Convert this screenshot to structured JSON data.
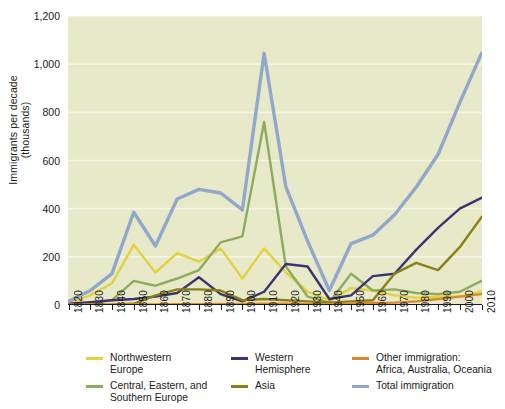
{
  "chart_data": {
    "type": "line",
    "title": "",
    "xlabel": "",
    "ylabel": "Immigrants per decade\n(thousands)",
    "ylabel_line1": "Immigrants per decade",
    "ylabel_line2": "(thousands)",
    "ylim": [
      0,
      1200
    ],
    "ytick_step": 200,
    "yticks": [
      0,
      200,
      400,
      600,
      800,
      1000,
      1200
    ],
    "ytick_labels": [
      "0",
      "200",
      "400",
      "600",
      "800",
      "1,000",
      "1,200"
    ],
    "grid": true,
    "grid_color": "#f4f5e4",
    "plot_background": "#e8e9c9",
    "legend_position": "bottom",
    "x": [
      1820,
      1830,
      1840,
      1850,
      1860,
      1870,
      1880,
      1890,
      1900,
      1910,
      1920,
      1930,
      1940,
      1950,
      1960,
      1970,
      1980,
      1990,
      2000,
      2010
    ],
    "xtick_labels": [
      "1820",
      "1830",
      "1840",
      "1850",
      "1860",
      "1870",
      "1880",
      "1890",
      "1900",
      "1910",
      "1920",
      "1930",
      "1940",
      "1950",
      "1960",
      "1970",
      "1980",
      "1990",
      "2000",
      "2010"
    ],
    "series": [
      {
        "name": "Northwestern Europe",
        "color": "#e3d23f",
        "values": [
          8,
          40,
          90,
          250,
          135,
          215,
          180,
          235,
          110,
          235,
          135,
          55,
          20,
          70,
          60,
          40,
          30,
          35,
          35,
          55
        ]
      },
      {
        "name": "Central, Eastern, and Southern Europe",
        "color": "#8bac5f",
        "values": [
          2,
          5,
          20,
          100,
          80,
          110,
          145,
          260,
          285,
          760,
          160,
          35,
          10,
          130,
          60,
          65,
          50,
          45,
          55,
          100
        ]
      },
      {
        "name": "Western Hemisphere",
        "color": "#3c3470",
        "values": [
          5,
          12,
          20,
          25,
          35,
          50,
          115,
          45,
          15,
          55,
          170,
          160,
          25,
          40,
          120,
          130,
          230,
          320,
          400,
          445
        ]
      },
      {
        "name": "Asia",
        "color": "#8a8019",
        "values": [
          1,
          1,
          2,
          5,
          40,
          65,
          65,
          60,
          20,
          25,
          20,
          15,
          10,
          15,
          20,
          130,
          175,
          145,
          240,
          365
        ]
      },
      {
        "name": "Other immigration: Africa, Australia, Oceania",
        "color": "#d78a2b",
        "values": [
          1,
          1,
          1,
          2,
          2,
          3,
          3,
          4,
          4,
          5,
          5,
          4,
          3,
          5,
          8,
          10,
          15,
          25,
          35,
          45
        ]
      },
      {
        "name": "Total immigration",
        "color": "#8fa8cc",
        "values": [
          15,
          60,
          130,
          385,
          245,
          440,
          480,
          465,
          395,
          1045,
          490,
          265,
          60,
          255,
          290,
          375,
          490,
          625,
          840,
          1045
        ]
      }
    ]
  },
  "legend": {
    "items": [
      {
        "label": "Northwestern\nEurope",
        "color": "#e3d23f",
        "name": "legend-northwestern-europe"
      },
      {
        "label": "Central, Eastern, and\nSouthern Europe",
        "color": "#8bac5f",
        "name": "legend-central-eastern-southern-europe"
      },
      {
        "label": "Western\nHemisphere",
        "color": "#3c3470",
        "name": "legend-western-hemisphere"
      },
      {
        "label": "Asia",
        "color": "#8a8019",
        "name": "legend-asia"
      },
      {
        "label": "Other immigration:\nAfrica, Australia, Oceania",
        "color": "#d78a2b",
        "name": "legend-other-immigration"
      },
      {
        "label": "Total immigration",
        "color": "#8fa8cc",
        "name": "legend-total-immigration"
      }
    ]
  }
}
